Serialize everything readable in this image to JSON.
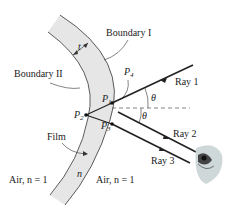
{
  "diagram": {
    "type": "thin-film-interference",
    "labels": {
      "boundary_1": "Boundary I",
      "boundary_2": "Boundary II",
      "thickness": "t",
      "film": "Film",
      "film_index": "n",
      "air_left": "Air, n = 1",
      "air_right": "Air, n = 1",
      "angle": "θ",
      "p1": "P",
      "p1_sub": "1",
      "p2": "P",
      "p2_sub": "2",
      "p3": "P",
      "p3_sub": "3",
      "p4": "P",
      "p4_sub": "4",
      "ray1": "Ray 1",
      "ray2": "Ray 2",
      "ray3": "Ray 3"
    },
    "colors": {
      "film_fill": "#e6e6e6",
      "line": "#333333",
      "ray": "#222222",
      "eye_fill": "#cfd8d8"
    }
  }
}
